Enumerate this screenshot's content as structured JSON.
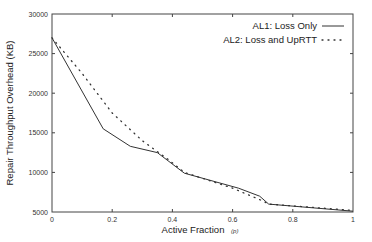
{
  "chart_data": {
    "type": "line",
    "title": "",
    "xlabel": "Active Fraction",
    "xlabel_symbol": "(p)",
    "ylabel": "Repair Throughput Overhead (KB)",
    "xlim": [
      0,
      1
    ],
    "ylim": [
      5000,
      30000
    ],
    "x_ticks": [
      "0",
      "0.2",
      "0.4",
      "0.6",
      "0.8",
      "1"
    ],
    "y_ticks": [
      "5000",
      "10000",
      "15000",
      "20000",
      "25000",
      "30000"
    ],
    "grid": false,
    "legend_position": "top-right",
    "series": [
      {
        "name": "AL1: Loss Only",
        "style": "solid",
        "color": "#333333",
        "x": [
          0,
          0.17,
          0.26,
          0.35,
          0.44,
          0.62,
          0.69,
          0.72,
          1.0
        ],
        "values": [
          27000,
          15500,
          13300,
          12500,
          9900,
          8000,
          7000,
          6000,
          5100
        ]
      },
      {
        "name": "AL2: Loss and UpRTT",
        "style": "dotted",
        "color": "#333333",
        "x": [
          0,
          0.1,
          0.2,
          0.3,
          0.38,
          0.44,
          0.6,
          0.7,
          0.72,
          1.0
        ],
        "values": [
          27000,
          22500,
          17500,
          14000,
          11800,
          10000,
          8000,
          6400,
          6000,
          5200
        ]
      }
    ]
  }
}
